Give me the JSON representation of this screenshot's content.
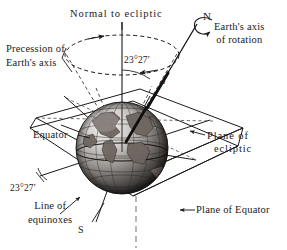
{
  "figure": {
    "width": 287,
    "height": 250,
    "background": "#ffffff",
    "ink_color": "#1a1a1a",
    "guide_color": "#9a9a9a"
  },
  "labels": {
    "normal_to_ecliptic": "Normal to ecliptic",
    "north_pole": "N",
    "south_pole": "S",
    "earths_axis_line1": "Earth's axis",
    "earths_axis_line2": "of rotation",
    "precession_line1": "Precession of",
    "precession_line2": "Earth's axis",
    "obliquity_top": "23°27′",
    "obliquity_bottom": "23°27′",
    "angular_velocity": "ω",
    "equator": "Equator",
    "line_of_equinoxes_line1": "Line of",
    "line_of_equinoxes_line2": "equinoxes",
    "plane_of_ecliptic_line1": "Plane of",
    "plane_of_ecliptic_line2": "ecliptic",
    "plane_of_equator": "Plane of Equator"
  },
  "diagram_data": {
    "type": "astronomical-schematic",
    "obliquity_degrees": 23,
    "obliquity_minutes": 27,
    "obliquity_text": "23°27′",
    "elements": [
      "normal-to-ecliptic vertical axis",
      "earth rotation axis tilted 23°27′",
      "dashed precession cone with direction arrows",
      "shaded earth globe with continents and graticule",
      "plane of ecliptic parallelogram",
      "plane of equator parallelogram",
      "line of equinoxes where planes intersect",
      "rotation arrow at north pole"
    ]
  }
}
